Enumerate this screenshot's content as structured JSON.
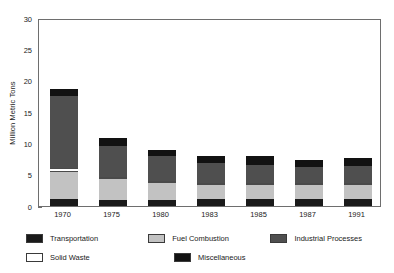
{
  "chart_data": {
    "type": "bar",
    "subtype": "stacked-vertical",
    "title": "",
    "subtitle": "",
    "xlabel": "",
    "ylabel": "Million Metric Tons",
    "ylim": [
      0,
      30
    ],
    "yticks": [
      0,
      5,
      10,
      15,
      20,
      25,
      30
    ],
    "ytick_labels": [
      "0",
      "5",
      "10",
      "15",
      "20",
      "25",
      "30"
    ],
    "grid": false,
    "legend_position": "below-axes",
    "categories": [
      "1970",
      "1975",
      "1980",
      "1983",
      "1985",
      "1987",
      "1991"
    ],
    "series": [
      {
        "name": "Transportation",
        "color": "#1a1a1a",
        "values": [
          1.1,
          1.0,
          1.0,
          1.1,
          1.1,
          1.1,
          1.1
        ]
      },
      {
        "name": "Fuel Combustion",
        "color": "#c2c2c2",
        "values": [
          4.4,
          3.3,
          2.7,
          2.3,
          2.3,
          2.2,
          2.2
        ]
      },
      {
        "name": "Solid Waste",
        "color": "#ffffff",
        "values": [
          0.6,
          0.3,
          0.3,
          0.2,
          0.2,
          0.2,
          0.2
        ]
      },
      {
        "name": "Industrial Processes",
        "color": "#4f4f4f",
        "values": [
          11.5,
          4.9,
          3.9,
          3.1,
          2.9,
          2.6,
          2.8
        ]
      },
      {
        "name": "Miscellaneous",
        "color": "#121212",
        "values": [
          1.1,
          1.3,
          1.1,
          1.2,
          1.3,
          1.1,
          1.2
        ]
      }
    ],
    "totals": [
      19.6,
      10.8,
      9.0,
      7.9,
      7.8,
      7.2,
      7.5
    ],
    "annotations": []
  },
  "legend": {
    "rows": [
      [
        {
          "label": "Transportation",
          "swatch": "transportation"
        },
        {
          "label": "Fuel Combustion",
          "swatch": "fuel"
        },
        {
          "label": "Industrial Processes",
          "swatch": "industrial"
        }
      ],
      [
        {
          "label": "Solid Waste",
          "swatch": "solid"
        },
        {
          "label": "Miscellaneous",
          "swatch": "misc"
        }
      ]
    ]
  },
  "colors": {
    "frame": "#6e6e6e",
    "text": "#1a1a1a",
    "background": "#ffffff"
  }
}
